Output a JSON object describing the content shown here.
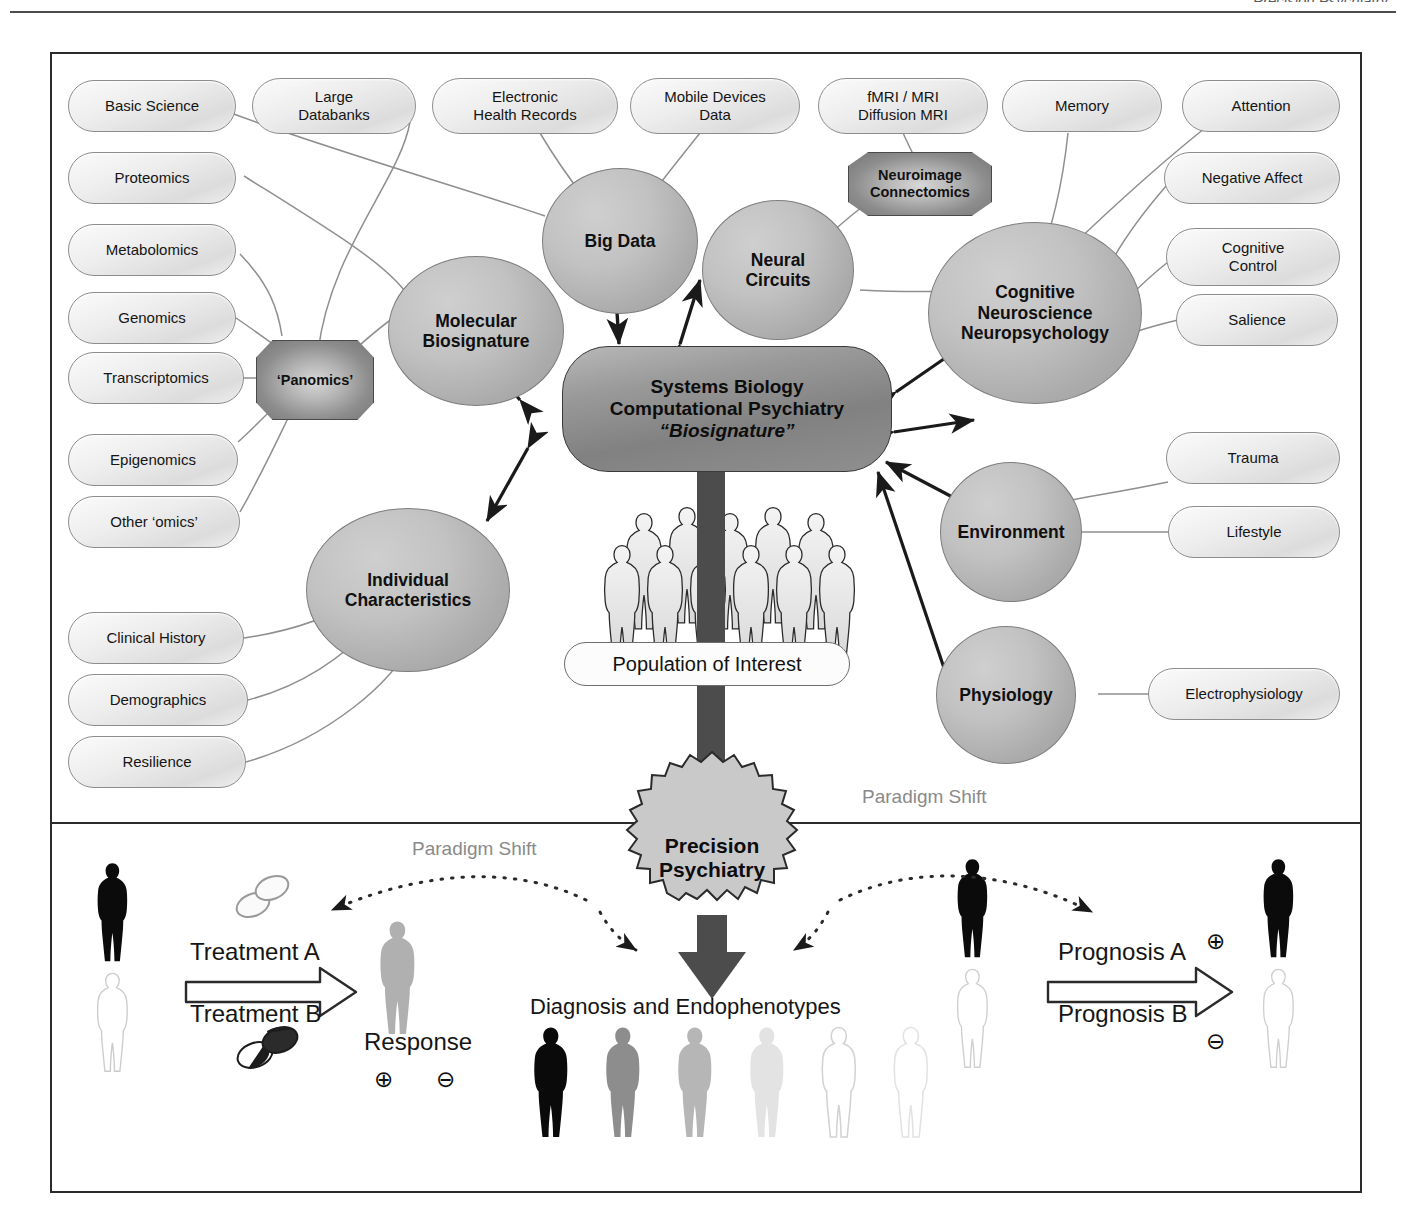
{
  "page": {
    "header_text": "Precision Psychiatry"
  },
  "figure": {
    "panels": [
      "discovery-panel",
      "application-panel"
    ],
    "hub": {
      "line1": "Systems Biology",
      "line2": "Computational Psychiatry",
      "line3": "“Biosignature”"
    },
    "hubs_secondary": [
      {
        "id": "molecular-biosignature",
        "line1": "Molecular",
        "line2": "Biosignature"
      },
      {
        "id": "big-data",
        "line1": "Big Data",
        "line2": ""
      },
      {
        "id": "neural-circuits",
        "line1": "Neural",
        "line2": "Circuits"
      },
      {
        "id": "cognitive-neuroscience",
        "line1": "Cognitive",
        "line2": "Neuroscience",
        "line3": "Neuropsychology"
      },
      {
        "id": "individual-characteristics",
        "line1": "Individual",
        "line2": "Characteristics"
      },
      {
        "id": "environment",
        "line1": "Environment",
        "line2": ""
      },
      {
        "id": "physiology",
        "line1": "Physiology",
        "line2": ""
      }
    ],
    "octagons": [
      {
        "id": "panomics",
        "line1": "‘Panomics’",
        "line2": ""
      },
      {
        "id": "neuroimage-connectomics",
        "line1": "Neuroimage",
        "line2": "Connectomics"
      }
    ],
    "leaf_labels": {
      "left_column": [
        "Basic Science",
        "Proteomics",
        "Metabolomics",
        "Genomics",
        "Transcriptomics",
        "Epigenomics",
        "Other ‘omics’",
        "Clinical History",
        "Demographics",
        "Resilience"
      ],
      "top_row": [
        "Large\nDatabanks",
        "Electronic\nHealth Records",
        "Mobile Devices\nData",
        "fMRI / MRI\nDiffusion MRI"
      ],
      "right_column": [
        "Memory",
        "Attention",
        "Negative Affect",
        "Cognitive\nControl",
        "Salience",
        "Trauma",
        "Lifestyle",
        "Electrophysiology"
      ]
    },
    "population_label": "Population of Interest",
    "starburst": {
      "line1": "Precision",
      "line2": "Psychiatry"
    },
    "paradigm_shift_left": "Paradigm Shift",
    "paradigm_shift_right": "Paradigm Shift",
    "application": {
      "treatment_a": "Treatment A",
      "treatment_b": "Treatment B",
      "response": "Response",
      "response_positive": "⊕",
      "response_negative": "⊖",
      "diagnosis": "Diagnosis and Endophenotypes",
      "prognosis_a": "Prognosis A",
      "prognosis_b": "Prognosis B",
      "prognosis_positive": "⊕",
      "prognosis_negative": "⊖"
    }
  },
  "colors": {
    "frame": "#2b2b2b",
    "hub_fill": "#8f8f8f",
    "bubble_fill": "#b4b4b4",
    "pill_fill": "#e7e7e7",
    "arrow": "#1a1a1a",
    "paradigm_text": "#8a8a8a",
    "big_arrow": "#4c4c4c"
  }
}
